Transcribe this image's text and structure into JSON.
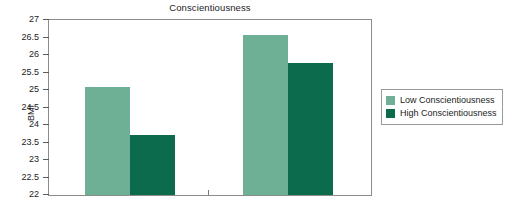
{
  "chart_data": {
    "type": "bar",
    "title": "Conscientiousness",
    "xlabel": "",
    "ylabel": "BMI",
    "categories": [
      "Females",
      "Males"
    ],
    "series": [
      {
        "name": "Low Conscientiousness",
        "color": "#6db096",
        "values": [
          25.1,
          26.58
        ]
      },
      {
        "name": "High Conscientiousness",
        "color": "#0c6b4c",
        "values": [
          23.72,
          25.78
        ]
      }
    ],
    "ylim": [
      22,
      27
    ],
    "ytick_step": 0.5,
    "ytick_labels": [
      "27",
      "26.5",
      "26",
      "25.5",
      "25",
      "24.5",
      "24",
      "23.5",
      "23",
      "22.5",
      "22"
    ],
    "ytick_values": [
      27,
      26.5,
      26,
      25.5,
      25,
      24.5,
      24,
      23.5,
      23,
      22.5,
      22
    ],
    "grid": false,
    "legend_position": "right",
    "frame": true
  },
  "legend": {
    "entries": [
      {
        "label": "Low Conscientiousness",
        "color": "#6db096"
      },
      {
        "label": "High Conscientiousness",
        "color": "#0c6b4c"
      }
    ]
  }
}
